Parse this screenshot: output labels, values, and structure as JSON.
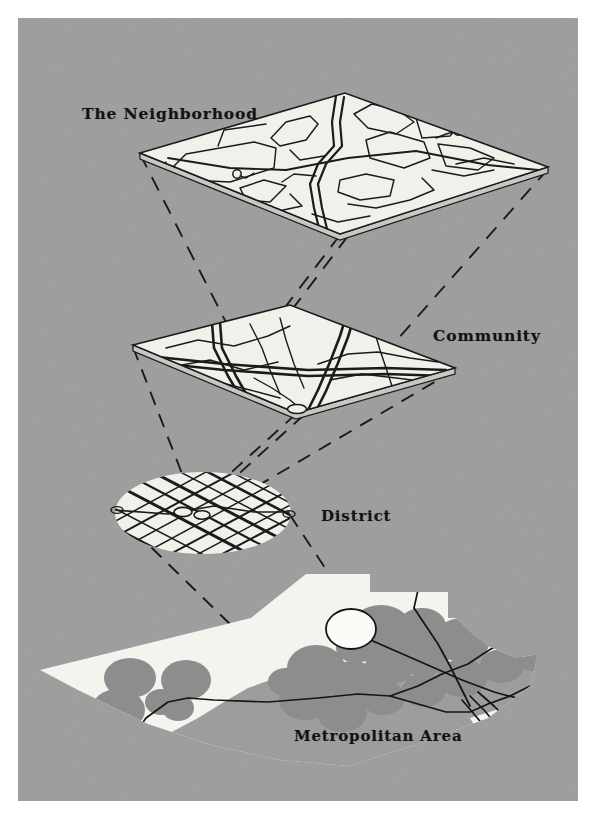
{
  "figure": {
    "kind": "hierarchy-of-urban-scales-diagram",
    "title_visible": false,
    "background_color": "#9d9d9d",
    "plate_margin_color": "#ffffff",
    "ink_color": "#121212",
    "surface_fill": "#f2f0ea"
  },
  "labels": {
    "neighborhood": "The Neighborhood",
    "community": "Community",
    "district": "District",
    "metropolitan": "Metropolitan Area"
  },
  "layers": [
    {
      "id": "neighborhood",
      "label": "The Neighborhood",
      "shape": "isometric-square-plane",
      "level": 1,
      "scale_order": "smallest",
      "street_pattern": "curvilinear-suburban-with-cul-de-sacs",
      "cul_de_sac_count": 2,
      "label_position": "upper-left"
    },
    {
      "id": "community",
      "label": "Community",
      "shape": "isometric-square-plane",
      "level": 2,
      "street_pattern": "four-quadrants-with-arterial-roads",
      "quadrant_count": 4,
      "label_position": "right"
    },
    {
      "id": "district",
      "label": "District",
      "shape": "ellipse",
      "level": 3,
      "street_pattern": "dense-diagonal-grid",
      "label_position": "right"
    },
    {
      "id": "metropolitan",
      "label": "Metropolitan Area",
      "shape": "coastal-landmass",
      "level": 4,
      "scale_order": "largest",
      "content": "gray-district-blobs-with-highway-network",
      "district_blob_count": 22,
      "highlighted_district": "white-open-circle",
      "label_position": "bottom-center"
    }
  ],
  "connectors": {
    "style": "dashed",
    "description": "dashed projection lines linking each plane corner down to the next larger scale",
    "count": 12
  },
  "colors": {
    "plate": "#9d9d9d",
    "surface": "#f2f0ea",
    "ink": "#121212",
    "blob": "#8d8d8d",
    "metro_land": "#f5f3ee"
  }
}
